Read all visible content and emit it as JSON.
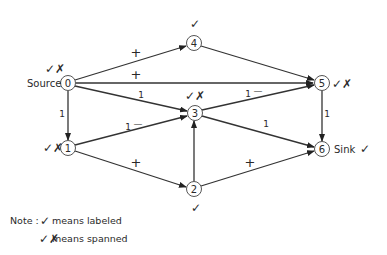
{
  "diagram": {
    "nodes": [
      {
        "id": "0",
        "label": "0",
        "x": 68,
        "y": 83,
        "name_label": "Source",
        "mark": "spanned"
      },
      {
        "id": "1",
        "label": "1",
        "x": 68,
        "y": 148,
        "mark": "spanned"
      },
      {
        "id": "2",
        "label": "2",
        "x": 194,
        "y": 189,
        "mark": "labeled"
      },
      {
        "id": "3",
        "label": "3",
        "x": 195,
        "y": 113,
        "mark": "spanned"
      },
      {
        "id": "4",
        "label": "4",
        "x": 194,
        "y": 43,
        "mark": "labeled"
      },
      {
        "id": "5",
        "label": "5",
        "x": 322,
        "y": 83,
        "mark": "spanned"
      },
      {
        "id": "6",
        "label": "6",
        "x": 322,
        "y": 149,
        "name_label": "Sink",
        "mark": "labeled"
      }
    ],
    "edges": [
      {
        "from": "0",
        "to": "4",
        "label": "+"
      },
      {
        "from": "0",
        "to": "5",
        "label": "+"
      },
      {
        "from": "0",
        "to": "3",
        "label": "1"
      },
      {
        "from": "0",
        "to": "1",
        "label": "1"
      },
      {
        "from": "1",
        "to": "3",
        "label": "1 —"
      },
      {
        "from": "1",
        "to": "2",
        "label": "+"
      },
      {
        "from": "4",
        "to": "5",
        "label": ""
      },
      {
        "from": "3",
        "to": "5",
        "label": "1 —"
      },
      {
        "from": "3",
        "to": "6",
        "label": "1"
      },
      {
        "from": "2",
        "to": "3",
        "label": ""
      },
      {
        "from": "2",
        "to": "6",
        "label": "+"
      },
      {
        "from": "5",
        "to": "6",
        "label": "1"
      }
    ],
    "labels": {
      "source": "Source",
      "sink": "Sink",
      "n0": "0",
      "n1": "1",
      "n2": "2",
      "n3": "3",
      "n4": "4",
      "n5": "5",
      "n6": "6",
      "e04": "+",
      "e05": "+",
      "e03": "1",
      "e01": "1",
      "e13_num": "1",
      "e13_sign": "—",
      "e12": "+",
      "e35_num": "1",
      "e35_sign": "—",
      "e36": "1",
      "e26": "+",
      "e56": "1"
    },
    "marks": {
      "labeled_glyph": "✓",
      "spanned_glyph": "✓✗"
    }
  },
  "note": {
    "prefix": "Note :",
    "line1": "means  labeled",
    "line2": "means  spanned"
  }
}
